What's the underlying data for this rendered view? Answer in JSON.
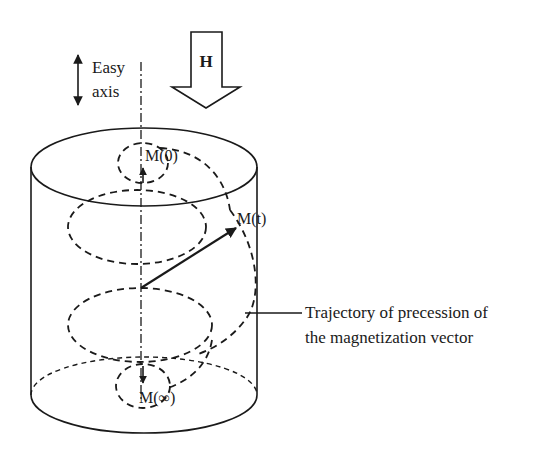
{
  "diagram": {
    "easy_axis": {
      "line1": "Easy",
      "line2": "axis"
    },
    "field": {
      "label": "H"
    },
    "vectors": {
      "initial": "M(0)",
      "current": "M(t)",
      "final": "M(∞)"
    },
    "annotation": {
      "line1": "Trajectory of precession of",
      "line2": "the magnetization vector"
    },
    "colors": {
      "ink": "#1a1a1a",
      "background": "#ffffff"
    }
  }
}
